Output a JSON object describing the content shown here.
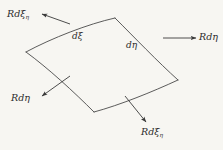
{
  "figure": {
    "background_color": "#f7f6f2",
    "stroke_color": "#4a4a4a",
    "text_color": "#2b2b2b",
    "patch": {
      "name": "curved-surface-element",
      "fill": "#f7f6f2"
    },
    "inner_labels": {
      "d_xi": "dξ",
      "d_eta": "dη"
    },
    "outer_labels": {
      "top_left": {
        "base": "Rd",
        "symbol": "ξ",
        "subscript": "η"
      },
      "right": {
        "base": "Rd",
        "symbol": "η",
        "subscript": ""
      },
      "bottom_left": {
        "base": "Rd",
        "symbol": "η",
        "subscript": ""
      },
      "bottom_right": {
        "base": "Rd",
        "symbol": "ξ",
        "subscript": "η"
      }
    },
    "outer_label_text": {
      "top_left": "Rdξ",
      "top_left_sub": "η",
      "right": "Rdη",
      "bottom_left": "Rdη",
      "bottom_right": "Rdξ",
      "bottom_right_sub": "η"
    },
    "arrows": {
      "top_left_direction": "up-left",
      "right_direction": "right",
      "bottom_left_direction": "down-left",
      "bottom_right_direction": "down-right"
    }
  }
}
